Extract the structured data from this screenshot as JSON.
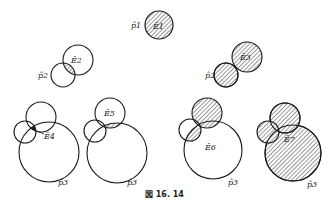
{
  "figure": {
    "caption": "図 16. 14",
    "labels": {
      "p1": "p̂1",
      "e1": "Ê1",
      "p2a": "p̂2",
      "e2": "Ê2",
      "p2b": "p̂2",
      "e3": "Ê3",
      "p3a": "p̂3",
      "e4": "Ê4",
      "p3b": "p̂3",
      "e5": "Ê5",
      "p3c": "p̂3",
      "e6": "Ê6",
      "p3d": "p̂3",
      "e7": "Ê7"
    },
    "colors": {
      "stroke": "#1a1a1a",
      "hatch": "#444444",
      "background": "#ffffff"
    }
  }
}
